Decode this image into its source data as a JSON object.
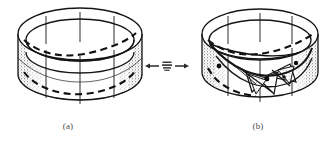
{
  "figure": {
    "kind": "line-drawing",
    "background_color": "#ffffff",
    "ink_color": "#151515",
    "shade_color": "#e9e9e9",
    "panels": [
      {
        "id": "a",
        "caption": "(a)",
        "title": "unbuckled circular cylindrical band",
        "features": [
          "outer top rim ellipse",
          "inner top rim ellipse",
          "bottom rim arc",
          "vertical meridian lines",
          "dashed circumferential curve on upper band",
          "dashed circumferential curve on lower band",
          "stippled shading on left and right flanks"
        ]
      },
      {
        "id": "b",
        "caption": "(b)",
        "title": "buckled cylindrical band with twisted folded surface",
        "features": [
          "outer top rim ellipse",
          "inner top rim ellipse",
          "bottom rim arc",
          "vertical meridian lines",
          "dashed circumferential curve on upper band",
          "collapsed saddle surface with triangular folds",
          "dark vertex nodes on fold creases",
          "stippled shading on left and right flanks"
        ]
      }
    ],
    "connector": {
      "type": "double-headed-arrow",
      "left_arrow": "←",
      "right_arrow": "→",
      "center_symbol": "≣",
      "meaning": "reversible transition between states"
    }
  }
}
